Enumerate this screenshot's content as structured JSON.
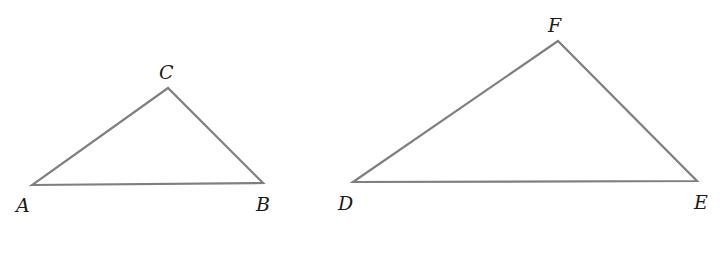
{
  "figure": {
    "width": 722,
    "height": 262,
    "background": "#ffffff",
    "stroke_color": "#7f7f7f",
    "label_color": "#1a1a1a"
  },
  "triangles": [
    {
      "name": "ABC",
      "vertices": {
        "A": {
          "x": 32,
          "y": 185
        },
        "B": {
          "x": 263,
          "y": 183
        },
        "C": {
          "x": 168,
          "y": 88
        }
      },
      "labels": [
        {
          "text": "A",
          "x": 16,
          "y": 212
        },
        {
          "text": "B",
          "x": 256,
          "y": 211
        },
        {
          "text": "C",
          "x": 159,
          "y": 79
        }
      ]
    },
    {
      "name": "DEF",
      "vertices": {
        "D": {
          "x": 353,
          "y": 182
        },
        "E": {
          "x": 697,
          "y": 181
        },
        "F": {
          "x": 558,
          "y": 41
        }
      },
      "labels": [
        {
          "text": "D",
          "x": 338,
          "y": 210
        },
        {
          "text": "E",
          "x": 694,
          "y": 209
        },
        {
          "text": "F",
          "x": 548,
          "y": 32
        }
      ]
    }
  ]
}
